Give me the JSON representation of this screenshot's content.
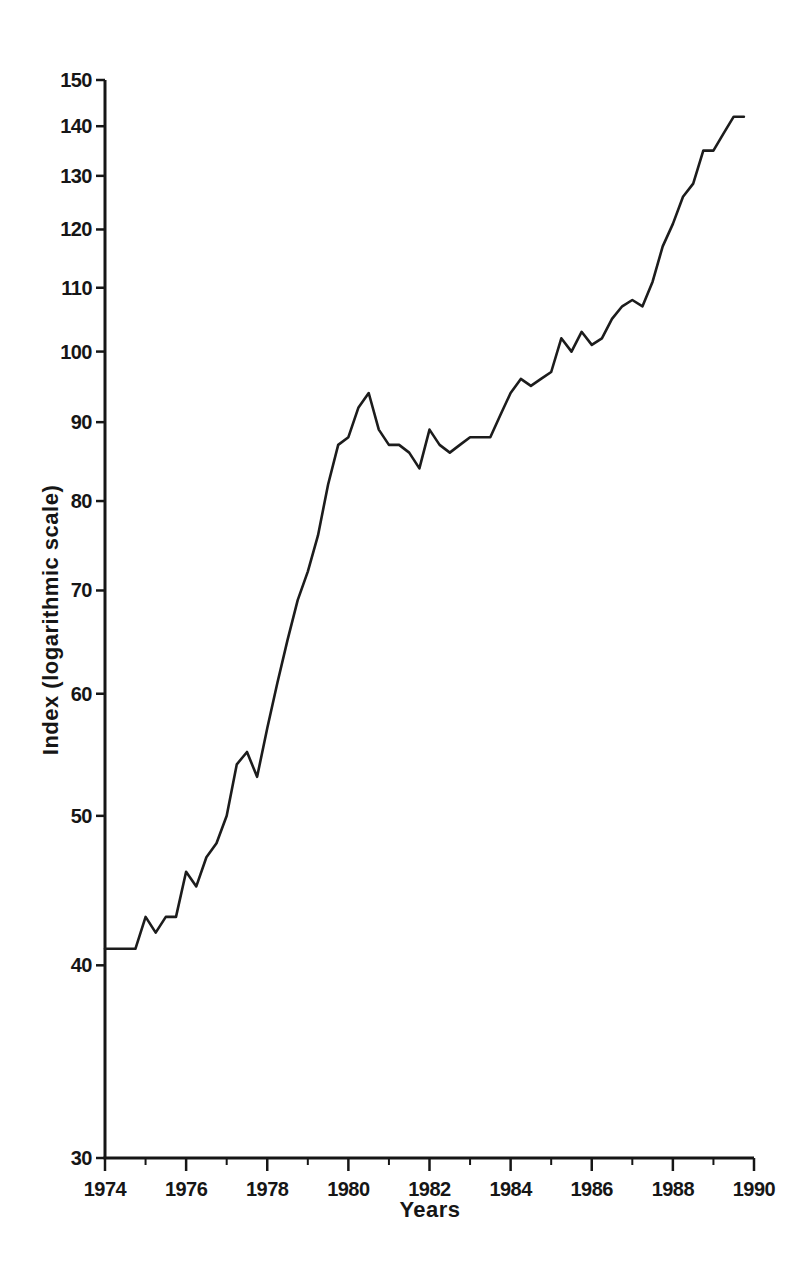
{
  "page": {
    "background": "#ffffff",
    "ink_color": "#161616"
  },
  "chart_data": {
    "type": "line",
    "title": "",
    "xlabel": "Years",
    "ylabel": "Index (logarithmic scale)",
    "y_scale": "logarithmic",
    "xlim": [
      1974,
      1990
    ],
    "ylim": [
      30,
      150
    ],
    "grid": false,
    "legend": "none",
    "line_color": "#1c1c1c",
    "y_ticks": [
      30,
      40,
      50,
      60,
      70,
      80,
      90,
      100,
      110,
      120,
      130,
      140,
      150
    ],
    "x_major_ticks": [
      1974,
      1976,
      1978,
      1980,
      1982,
      1984,
      1986,
      1988,
      1990
    ],
    "x_major_tick_labels": [
      "1974",
      "1976",
      "1978",
      "1980",
      "1982",
      "1984",
      "1986",
      "1988",
      "1990"
    ],
    "x_minor_ticks": [
      1975,
      1977,
      1979,
      1981,
      1983,
      1985,
      1987,
      1989
    ],
    "series_name": "Index (quarterly)",
    "x": [
      1974.0,
      1974.25,
      1974.5,
      1974.75,
      1975.0,
      1975.25,
      1975.5,
      1975.75,
      1976.0,
      1976.25,
      1976.5,
      1976.75,
      1977.0,
      1977.25,
      1977.5,
      1977.75,
      1978.0,
      1978.25,
      1978.5,
      1978.75,
      1979.0,
      1979.25,
      1979.5,
      1979.75,
      1980.0,
      1980.25,
      1980.5,
      1980.75,
      1981.0,
      1981.25,
      1981.5,
      1981.75,
      1982.0,
      1982.25,
      1982.5,
      1982.75,
      1983.0,
      1983.25,
      1983.5,
      1983.75,
      1984.0,
      1984.25,
      1984.5,
      1984.75,
      1985.0,
      1985.25,
      1985.5,
      1985.75,
      1986.0,
      1986.25,
      1986.5,
      1986.75,
      1987.0,
      1987.25,
      1987.5,
      1987.75,
      1988.0,
      1988.25,
      1988.5,
      1988.75,
      1989.0,
      1989.25,
      1989.5,
      1989.75
    ],
    "values": [
      41,
      41,
      41,
      41,
      43,
      42,
      43,
      43,
      46,
      45,
      47,
      48,
      50,
      54,
      55,
      53,
      57,
      61,
      65,
      69,
      72,
      76,
      82,
      87,
      88,
      92,
      94,
      89,
      87,
      87,
      86,
      84,
      89,
      87,
      86,
      87,
      88,
      88,
      88,
      91,
      94,
      96,
      95,
      96,
      97,
      102,
      100,
      103,
      101,
      102,
      105,
      107,
      108,
      107,
      111,
      117,
      121,
      126,
      128.5,
      135,
      135,
      138.5,
      142,
      142
    ]
  }
}
